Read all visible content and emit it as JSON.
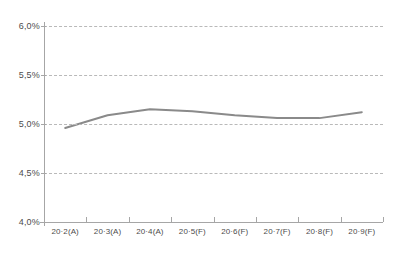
{
  "chart_data": {
    "type": "line",
    "title": "",
    "subtitle": "",
    "xlabel": "",
    "ylabel": "",
    "categories": [
      "20·2(A)",
      "20·3(A)",
      "20·4(A)",
      "20·5(F)",
      "20·6(F)",
      "20·7(F)",
      "20·8(F)",
      "20·9(F)"
    ],
    "values": [
      4.96,
      5.09,
      5.15,
      5.13,
      5.09,
      5.06,
      5.06,
      5.12
    ],
    "ylim": [
      4.0,
      6.0
    ],
    "ytick_values": [
      6.0,
      5.5,
      5.0,
      4.5,
      4.0
    ],
    "ytick_labels": [
      "6,0%",
      "5,5%",
      "5,0%",
      "4,5%",
      "4,0%"
    ],
    "grid": true,
    "grid_axis": "y",
    "grid_style": "dashed",
    "legend": false,
    "legend_position": "none",
    "series": [
      {
        "name": "",
        "values": [
          4.96,
          5.09,
          5.15,
          5.13,
          5.09,
          5.06,
          5.06,
          5.12
        ]
      }
    ]
  },
  "colors": {
    "line": "#8a8a8a",
    "grid": "#b9b9b9",
    "axis": "#a6a6a6",
    "tick_text": "#4c4c4c",
    "background": "#ffffff"
  }
}
